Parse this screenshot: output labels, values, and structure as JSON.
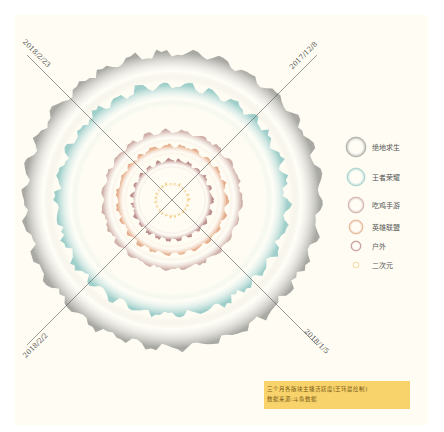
{
  "chart_data": {
    "type": "radial-area",
    "title": "三个月各版块主播活跃度(王玮晨绘制)",
    "source": "数据来源:斗鱼数据",
    "axis_dates": [
      "2017/12/8",
      "2018/1/5",
      "2018/2/2",
      "2018/2/23"
    ],
    "series": [
      {
        "name": "绝地求生",
        "color": "#9a9a96",
        "relative_radius": 1.0
      },
      {
        "name": "王者荣耀",
        "color": "#8fc7c4",
        "relative_radius": 0.78
      },
      {
        "name": "吃鸡手游",
        "color": "#c7a39c",
        "relative_radius": 0.47
      },
      {
        "name": "英雄联盟",
        "color": "#e0a07a",
        "relative_radius": 0.37
      },
      {
        "name": "户外",
        "color": "#b07a78",
        "relative_radius": 0.27
      },
      {
        "name": "二次元",
        "color": "#f2cc85",
        "relative_radius": 0.11
      }
    ]
  },
  "note": {
    "line1": "三个月各版块主播活跃度(王玮晨绘制)",
    "line2": "数据来源:斗鱼数据"
  }
}
